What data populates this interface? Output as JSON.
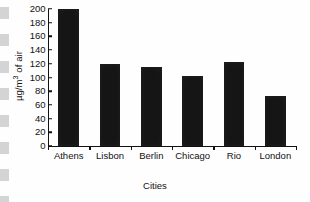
{
  "chart_data": {
    "type": "bar",
    "title": "",
    "subtitle": "",
    "xlabel": "Cities",
    "ylabel": "µg/m³ of air",
    "ylabel_prefix": "µg/m",
    "ylabel_exponent": "3",
    "ylabel_suffix": " of air",
    "categories": [
      "Athens",
      "Lisbon",
      "Berlin",
      "Chicago",
      "Rio",
      "London"
    ],
    "values": [
      200,
      120,
      115,
      102,
      122,
      73
    ],
    "ylim": [
      0,
      200
    ],
    "ytick_values": [
      0,
      20,
      40,
      60,
      80,
      100,
      120,
      140,
      160,
      180,
      200
    ],
    "ytick_labels": [
      "0",
      "20",
      "40",
      "60",
      "80",
      "100",
      "120",
      "140",
      "160",
      "180",
      "200"
    ],
    "grid": false,
    "legend": false,
    "legend_position": "none",
    "bar_color": "#151515",
    "axis_color": "#111111",
    "background_color": "#ffffff"
  }
}
